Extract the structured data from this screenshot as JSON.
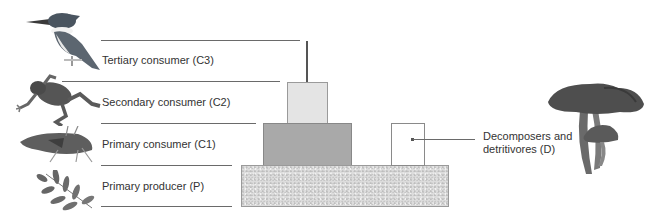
{
  "diagram": {
    "type": "ecological energy pyramid",
    "levels": [
      {
        "id": "C3",
        "label": "Tertiary consumer (C3)",
        "organism_icon": "kingfisher-bird-icon"
      },
      {
        "id": "C2",
        "label": "Secondary consumer (C2)",
        "organism_icon": "frog-icon"
      },
      {
        "id": "C1",
        "label": "Primary consumer (C1)",
        "organism_icon": "grasshopper-icon"
      },
      {
        "id": "P",
        "label": "Primary producer (P)",
        "organism_icon": "leaves-icon"
      }
    ],
    "decomposers": {
      "id": "D",
      "label_line1": "Decomposers and",
      "label_line2": "detritivores (D)",
      "organism_icon": "mushroom-icon"
    },
    "colors": {
      "line": "#6a6a6a",
      "c3_bar": "#555555",
      "c2_block": "#e4e4e4",
      "c1_block": "#a9a9a9",
      "producer_block": "#dcdcdc",
      "decomposer_box": "#ffffff"
    }
  }
}
